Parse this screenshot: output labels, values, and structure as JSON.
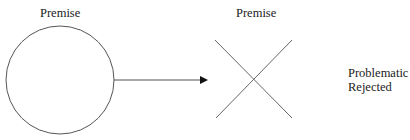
{
  "diagram": {
    "left_node": {
      "label": "Premise",
      "shape": "circle"
    },
    "connector": {
      "type": "arrow",
      "direction": "right"
    },
    "right_node": {
      "label": "Premise",
      "shape": "cross"
    },
    "status": {
      "line1": "Problematic",
      "line2": "Rejected"
    },
    "colors": {
      "stroke": "#555555",
      "text": "#222222",
      "background": "#ffffff"
    }
  }
}
